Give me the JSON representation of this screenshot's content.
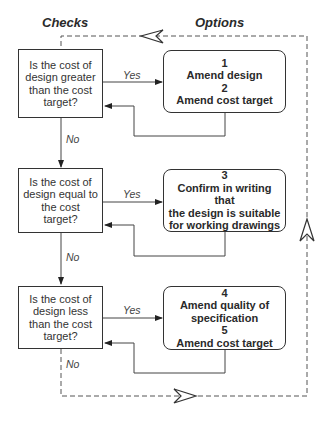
{
  "headers": {
    "checks": "Checks",
    "options": "Options"
  },
  "checks": [
    {
      "text": "Is the cost of design greater than the cost target?"
    },
    {
      "text": "Is the cost of design equal to the cost target?"
    },
    {
      "text": "Is the cost of design less than the cost target?"
    }
  ],
  "options": [
    {
      "lines": [
        "1",
        "Amend design",
        "2",
        "Amend cost target"
      ]
    },
    {
      "lines": [
        "3",
        "Confirm in writing that",
        "the design is suitable",
        "for working drawings"
      ]
    },
    {
      "lines": [
        "4",
        "Amend quality of",
        "specification",
        "5",
        "Amend cost target"
      ]
    }
  ],
  "labels": {
    "yes": "Yes",
    "no": "No"
  },
  "colors": {
    "line": "#333333",
    "background": "#ffffff"
  }
}
